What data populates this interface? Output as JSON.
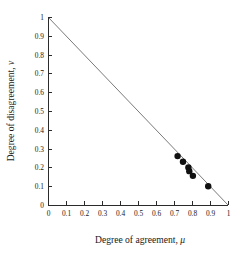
{
  "chart_data": {
    "type": "scatter",
    "title": "",
    "xlabel": "Degree of agreement, μ",
    "ylabel": "Degree of disagreement, ν",
    "xlim": [
      0,
      1
    ],
    "ylim": [
      0,
      1
    ],
    "grid": false,
    "legend": "none",
    "xticks": [
      "0",
      "0.1",
      "0.2",
      "0.3",
      "0.4",
      "0.5",
      "0.6",
      "0.7",
      "0.8",
      "0.9",
      "1"
    ],
    "yticks": [
      "0",
      "0.1",
      "0.2",
      "0.3",
      "0.4",
      "0.5",
      "0.6",
      "0.7",
      "0.8",
      "0.9",
      "1"
    ],
    "xtick_values": [
      0,
      0.1,
      0.2,
      0.3,
      0.4,
      0.5,
      0.6,
      0.7,
      0.8,
      0.9,
      1
    ],
    "ytick_values": [
      0,
      0.1,
      0.2,
      0.3,
      0.4,
      0.5,
      0.6,
      0.7,
      0.8,
      0.9,
      1
    ],
    "series": [
      {
        "name": "constraint line mu + nu = 1",
        "type": "line",
        "color": "#7a7a7a",
        "x": [
          0,
          1
        ],
        "y": [
          1,
          0
        ]
      },
      {
        "name": "data points",
        "type": "scatter",
        "color": "#111111",
        "marker": "circle",
        "marker_size": 3.2,
        "points": [
          {
            "x": 0.72,
            "y": 0.26
          },
          {
            "x": 0.75,
            "y": 0.23
          },
          {
            "x": 0.78,
            "y": 0.2
          },
          {
            "x": 0.785,
            "y": 0.18
          },
          {
            "x": 0.805,
            "y": 0.155
          },
          {
            "x": 0.89,
            "y": 0.1
          }
        ]
      }
    ]
  },
  "axes": {
    "x_label_text": "Degree of agreement,",
    "x_label_symbol": "μ",
    "y_label_text": "Degree of disagreement,",
    "y_label_symbol": "ν"
  }
}
